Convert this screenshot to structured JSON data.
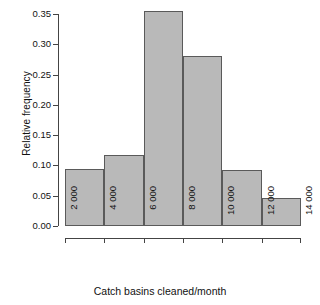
{
  "chart_data": {
    "type": "bar",
    "title": "",
    "subtitle": "",
    "xlabel": "Catch basins cleaned/month",
    "ylabel": "Relative frequency",
    "categories": [
      "2 000-4 000",
      "4 000-6 000",
      "6 000-8 000",
      "8 000-10 000",
      "10 000-12 000",
      "12 000-14 000"
    ],
    "bin_edges": [
      2000,
      4000,
      6000,
      8000,
      10000,
      12000,
      14000
    ],
    "values": [
      0.094,
      0.117,
      0.355,
      0.281,
      0.092,
      0.046
    ],
    "xtick_labels": [
      "2 000",
      "4 000",
      "6 000",
      "8 000",
      "10 000",
      "12 000",
      "14 000"
    ],
    "ytick_labels": [
      "0.00",
      "0.05",
      "0.10",
      "0.15",
      "0.20",
      "0.25",
      "0.30",
      "0.35"
    ],
    "ytick_values": [
      0.0,
      0.05,
      0.1,
      0.15,
      0.2,
      0.25,
      0.3,
      0.35
    ],
    "ylim": [
      0,
      0.35
    ],
    "xlim": [
      2000,
      14000
    ],
    "grid": false,
    "legend": false,
    "bar_fill_color": "#b9b9b9",
    "bar_border_color": "#5a5a5a",
    "axis_color": "#444444",
    "background_color": "#ffffff"
  }
}
